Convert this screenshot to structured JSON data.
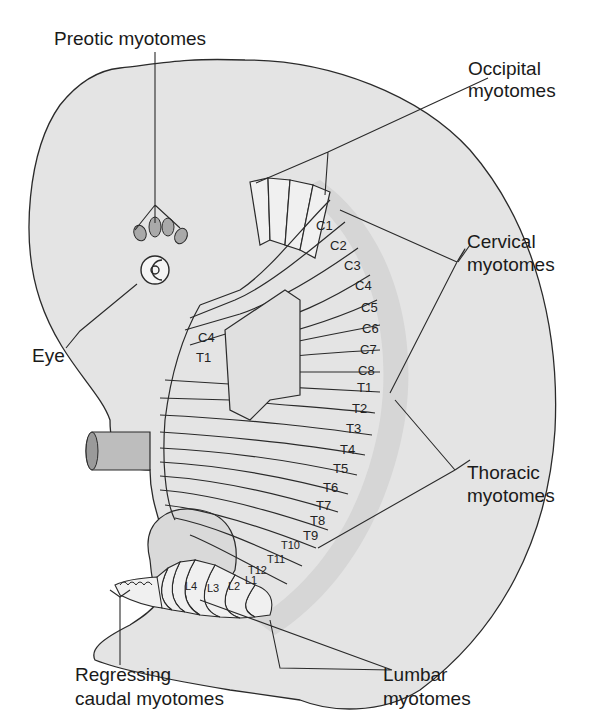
{
  "figure": {
    "labels": {
      "preotic": "Preotic myotomes",
      "occipital_1": "Occipital",
      "occipital_2": "myotomes",
      "cervical_1": "Cervical",
      "cervical_2": "myotomes",
      "eye": "Eye",
      "thoracic_1": "Thoracic",
      "thoracic_2": "myotomes",
      "regressing_1": "Regressing",
      "regressing_2": "caudal myotomes",
      "lumbar_1": "Lumbar",
      "lumbar_2": "myotomes"
    },
    "cervical_segments": [
      "C1",
      "C2",
      "C3",
      "C4",
      "C5",
      "C6",
      "C7",
      "C8"
    ],
    "thoracic_segments": [
      "T1",
      "T2",
      "T3",
      "T4",
      "T5",
      "T6",
      "T7",
      "T8",
      "T9",
      "T10",
      "T11",
      "T12"
    ],
    "lumbar_segments": [
      "L1",
      "L2",
      "L3",
      "L4"
    ],
    "inner_labels": {
      "c4_inner": "C4",
      "t1_inner": "T1"
    },
    "colors": {
      "body_fill": "#e4e4e4",
      "line": "#2a2a2a",
      "segment_fill": "#f0f0f0",
      "band_fill": "#d6d6d6"
    }
  }
}
